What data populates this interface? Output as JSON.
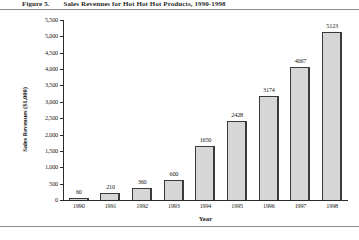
{
  "figure": {
    "caption_label": "Figure 5.",
    "caption_text": "Sales Revenues for Hot Hot Hot Products, 1990-1998"
  },
  "chart_data": {
    "type": "bar",
    "title": "",
    "xlabel": "Year",
    "ylabel": "Sales Revenues ($1,000)",
    "categories": [
      "1990",
      "1991",
      "1992",
      "1993",
      "1994",
      "1995",
      "1996",
      "1997",
      "1998"
    ],
    "values": [
      60,
      210,
      360,
      600,
      1650,
      2428,
      3174,
      4067,
      5123
    ],
    "value_labels": [
      "60",
      "210",
      "360",
      "600",
      "1650",
      "2428",
      "3174",
      "4067",
      "5123"
    ],
    "ylim": [
      0,
      5500
    ],
    "ytick_values": [
      0,
      500,
      1000,
      1500,
      2000,
      2500,
      3000,
      3500,
      4000,
      4500,
      5000,
      5500
    ],
    "ytick_labels": [
      "0",
      "500",
      "1,000",
      "1,500",
      "2,000",
      "2,500",
      "3,000",
      "3,500",
      "4,000",
      "4,500",
      "5,000",
      "5,500"
    ],
    "grid": false,
    "legend": null,
    "bar_fill": "#d6d6d6",
    "bar_border": "#3a3a3a"
  }
}
